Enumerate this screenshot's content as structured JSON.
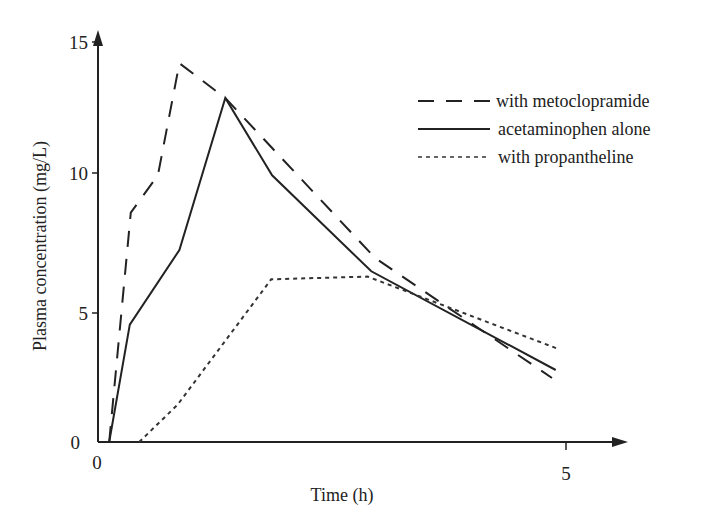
{
  "chart_data": {
    "type": "line",
    "title": "",
    "xlabel": "Time (h)",
    "ylabel": "Plasma concentration (mg/L)",
    "xlim": [
      0,
      5.6
    ],
    "ylim": [
      0,
      15.5
    ],
    "x_ticks": [
      0,
      5
    ],
    "y_ticks": [
      0,
      5,
      10,
      15
    ],
    "x_tick_labels": [
      "0",
      "5"
    ],
    "y_tick_labels": [
      "0",
      "5",
      "10",
      "15"
    ],
    "grid": false,
    "legend_position": "upper right",
    "series": [
      {
        "name": "with metoclopramide",
        "style": "dashed",
        "points": [
          [
            0.12,
            0
          ],
          [
            0.35,
            8.6
          ],
          [
            0.64,
            10.0
          ],
          [
            0.87,
            14.2
          ],
          [
            1.36,
            12.9
          ],
          [
            2.96,
            6.9
          ],
          [
            4.85,
            2.4
          ]
        ]
      },
      {
        "name": "acetaminophen alone",
        "style": "solid",
        "points": [
          [
            0.12,
            0
          ],
          [
            0.34,
            4.4
          ],
          [
            0.87,
            7.2
          ],
          [
            1.36,
            12.9
          ],
          [
            1.86,
            10.0
          ],
          [
            2.92,
            6.4
          ],
          [
            4.89,
            2.7
          ]
        ]
      },
      {
        "name": "with propantheline",
        "style": "dotted",
        "points": [
          [
            0.44,
            0
          ],
          [
            0.85,
            1.4
          ],
          [
            1.85,
            6.1
          ],
          [
            2.88,
            6.2
          ],
          [
            4.91,
            3.5
          ]
        ]
      }
    ]
  },
  "legend": {
    "items": [
      {
        "label": "with metoclopramide",
        "style": "dashed"
      },
      {
        "label": "acetaminophen alone",
        "style": "solid"
      },
      {
        "label": "with propantheline",
        "style": "dotted"
      }
    ]
  },
  "axes": {
    "x_title": "Time (h)",
    "y_title": "Plasma concentration (mg/L)",
    "x_tick_0": "0",
    "x_tick_5": "5",
    "y_tick_0": "0",
    "y_tick_5": "5",
    "y_tick_10": "10",
    "y_tick_15": "15"
  },
  "colors": {
    "ink": "#222222",
    "background": "#ffffff"
  }
}
